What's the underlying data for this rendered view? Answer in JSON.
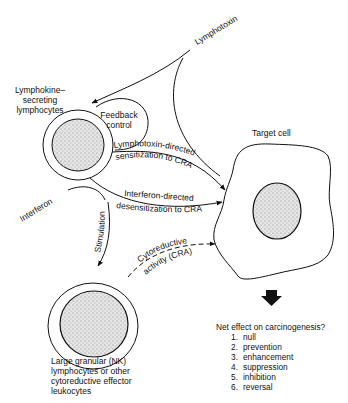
{
  "diagram": {
    "nodes": {
      "lymphotoxin": "Lymphotoxin",
      "lymphokine_cells_line1": "Lymphokine–",
      "lymphokine_cells_line2": "secreting",
      "lymphokine_cells_line3": "lymphocytes",
      "feedback_line1": "Feedback",
      "feedback_line2": "control",
      "target_cell": "Target cell",
      "interferon": "Interferon",
      "nk_line1": "Large granular (NK)",
      "nk_line2": "lymphocytes or other",
      "nk_line3": "cytoreductive effector",
      "nk_line4": "leukocytes"
    },
    "edges": {
      "lymphotoxin_sens_line1": "Lymphotoxin-directed",
      "lymphotoxin_sens_line2": "sensitization to CRA",
      "interferon_desens_line1": "Interferon-directed",
      "interferon_desens_line2": "desensitization to CRA",
      "stimulation": "Stimulation",
      "cra_line1": "Cytoreductive",
      "cra_line2": "activity (CRA)"
    },
    "outcome": {
      "question": "Net effect on carcinogenesis?",
      "options": [
        {
          "num": "1.",
          "label": "null"
        },
        {
          "num": "2.",
          "label": "prevention"
        },
        {
          "num": "3.",
          "label": "enhancement"
        },
        {
          "num": "4.",
          "label": "suppression"
        },
        {
          "num": "5.",
          "label": "inhibition"
        },
        {
          "num": "6.",
          "label": "reversal"
        }
      ]
    }
  }
}
